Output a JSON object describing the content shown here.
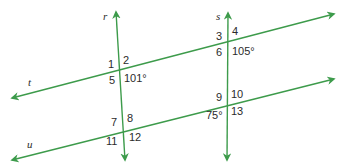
{
  "diagram": {
    "line_color": "#3d9b4b",
    "label_color": "#2b2b2b",
    "lines": {
      "r": {
        "label": "r",
        "x1": 125,
        "y1": 160,
        "x2": 116,
        "y2": 12
      },
      "s": {
        "label": "s",
        "x1": 227,
        "y1": 160,
        "x2": 228,
        "y2": 13
      },
      "t": {
        "label": "t",
        "x1": 12,
        "y1": 98,
        "x2": 334,
        "y2": 14
      },
      "u": {
        "label": "u",
        "x1": 12,
        "y1": 160,
        "x2": 334,
        "y2": 79
      }
    },
    "angle_labels": {
      "a1": "1",
      "a2": "2",
      "a3": "3",
      "a4": "4",
      "a5": "5",
      "a6": "6",
      "a7": "7",
      "a8": "8",
      "a9": "9",
      "a10": "10",
      "a11": "11",
      "a12": "12",
      "a13": "13"
    },
    "given_angles": {
      "at_r_t": "101°",
      "at_s_t": "105°",
      "at_s_u": "75°"
    }
  }
}
